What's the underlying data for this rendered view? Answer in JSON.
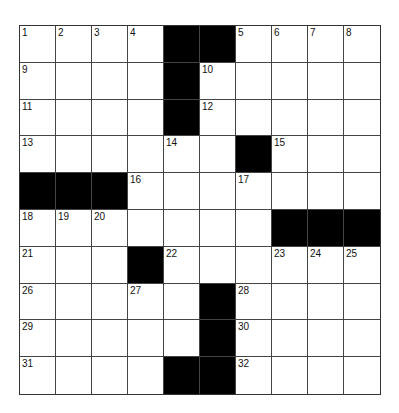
{
  "puzzle": {
    "rows": 10,
    "cols": 10,
    "grid": [
      [
        "1",
        "2",
        "3",
        "4",
        "#",
        "#",
        "5",
        "6",
        "7",
        "8"
      ],
      [
        "9",
        "",
        "",
        "",
        "#",
        "10",
        "",
        "",
        "",
        ""
      ],
      [
        "11",
        "",
        "",
        "",
        "#",
        "12",
        "",
        "",
        "",
        ""
      ],
      [
        "13",
        "",
        "",
        "",
        "14",
        "",
        "#",
        "15",
        "",
        ""
      ],
      [
        "#",
        "#",
        "#",
        "16",
        "",
        "",
        "17",
        "",
        "",
        ""
      ],
      [
        "18",
        "19",
        "20",
        "",
        "",
        "",
        "",
        "#",
        "#",
        "#"
      ],
      [
        "21",
        "",
        "",
        "#",
        "22",
        "",
        "",
        "23",
        "24",
        "25"
      ],
      [
        "26",
        "",
        "",
        "27",
        "",
        "#",
        "28",
        "",
        "",
        ""
      ],
      [
        "29",
        "",
        "",
        "",
        "",
        "#",
        "30",
        "",
        "",
        ""
      ],
      [
        "31",
        "",
        "",
        "",
        "#",
        "#",
        "32",
        "",
        "",
        ""
      ]
    ],
    "colors": {
      "block": "#000000",
      "cell": "#ffffff",
      "line": "#444444"
    }
  }
}
